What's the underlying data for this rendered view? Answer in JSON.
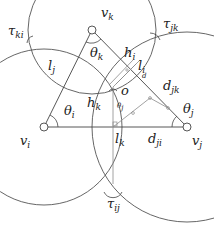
{
  "colors": {
    "stroke": "#444444",
    "light_stroke": "#8a8a8a",
    "background": "#ffffff",
    "text": "#222222"
  },
  "vertices": [
    {
      "id": "v_i",
      "base": "v",
      "sub": "i",
      "x": 44,
      "y": 127
    },
    {
      "id": "v_j",
      "base": "v",
      "sub": "j",
      "x": 187,
      "y": 127
    },
    {
      "id": "v_k",
      "base": "v",
      "sub": "k",
      "x": 92,
      "y": 30
    }
  ],
  "center_point": {
    "label": "o",
    "x": 113,
    "y": 87
  },
  "labels": {
    "v_i": {
      "base": "v",
      "sub": "i"
    },
    "v_j": {
      "base": "v",
      "sub": "j"
    },
    "v_k": {
      "base": "v",
      "sub": "k"
    },
    "theta_i": {
      "base": "θ",
      "sub": "i"
    },
    "theta_j": {
      "base": "θ",
      "sub": "j"
    },
    "theta_k": {
      "base": "θ",
      "sub": "k"
    },
    "theta_j_small": {
      "base": "θ",
      "sub": "j"
    },
    "l_i": {
      "base": "l",
      "sub": "i"
    },
    "l_j": {
      "base": "l",
      "sub": "j"
    },
    "l_k": {
      "base": "l",
      "sub": "k"
    },
    "h_i": {
      "base": "h",
      "sub": "i"
    },
    "h_k": {
      "base": "h",
      "sub": "k"
    },
    "d_jk": {
      "base": "d",
      "sub": "jk"
    },
    "d_ji": {
      "base": "d",
      "sub": "ji"
    },
    "d_small": {
      "base": "d"
    },
    "o": {
      "base": "o"
    },
    "tau_ki": {
      "base": "τ",
      "sub": "ki"
    },
    "tau_jk": {
      "base": "τ",
      "sub": "jk"
    },
    "tau_ij": {
      "base": "τ",
      "sub": "ij"
    }
  }
}
